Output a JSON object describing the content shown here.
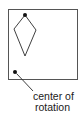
{
  "diagram": {
    "type": "rotation-figure",
    "frame": {
      "x": 8,
      "y": 9,
      "width": 69,
      "height": 70
    },
    "kite": {
      "points": [
        [
          25,
          15
        ],
        [
          14,
          29
        ],
        [
          25,
          56
        ],
        [
          36,
          30
        ]
      ],
      "marked_vertex": [
        25,
        15
      ]
    },
    "center_point": [
      15,
      72
    ],
    "annotation": {
      "line1": "center of",
      "line2": "rotation"
    },
    "colors": {
      "stroke": "#2a2a2a",
      "frame": "#555555",
      "dot": "#111111"
    }
  }
}
